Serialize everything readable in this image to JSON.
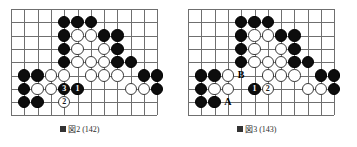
{
  "page": {
    "kind": "go-problem-diagram-pair",
    "width": 357,
    "height": 147,
    "background": "#ffffff"
  },
  "style": {
    "line_color": "#6f6f6f",
    "black_stone_color": "#0d0d0d",
    "white_stone_color": "#ffffff",
    "white_stone_border": "#3a3a3a",
    "label_color": "#000000"
  },
  "diagrams": [
    {
      "id": "left",
      "name": "figure-left",
      "caption": "図2 (142)",
      "origin_x": 11,
      "origin_y": 9,
      "pitch": 13.3,
      "cols": 12,
      "rows": 9,
      "stone_size": 12.4,
      "star_points": [
        {
          "c": 2,
          "r": 5
        }
      ],
      "stones": [
        {
          "c": 4,
          "r": 1,
          "color": "black",
          "label": ""
        },
        {
          "c": 5,
          "r": 1,
          "color": "black",
          "label": ""
        },
        {
          "c": 6,
          "r": 1,
          "color": "black",
          "label": ""
        },
        {
          "c": 4,
          "r": 2,
          "color": "black",
          "label": ""
        },
        {
          "c": 5,
          "r": 2,
          "color": "white",
          "label": ""
        },
        {
          "c": 6,
          "r": 2,
          "color": "white",
          "label": ""
        },
        {
          "c": 7,
          "r": 2,
          "color": "black",
          "label": ""
        },
        {
          "c": 8,
          "r": 2,
          "color": "black",
          "label": ""
        },
        {
          "c": 4,
          "r": 3,
          "color": "black",
          "label": ""
        },
        {
          "c": 5,
          "r": 3,
          "color": "white",
          "label": ""
        },
        {
          "c": 7,
          "r": 3,
          "color": "white",
          "label": ""
        },
        {
          "c": 8,
          "r": 3,
          "color": "black",
          "label": ""
        },
        {
          "c": 4,
          "r": 4,
          "color": "black",
          "label": ""
        },
        {
          "c": 5,
          "r": 4,
          "color": "white",
          "label": ""
        },
        {
          "c": 6,
          "r": 4,
          "color": "white",
          "label": ""
        },
        {
          "c": 7,
          "r": 4,
          "color": "white",
          "label": ""
        },
        {
          "c": 8,
          "r": 4,
          "color": "black",
          "label": ""
        },
        {
          "c": 9,
          "r": 4,
          "color": "black",
          "label": ""
        },
        {
          "c": 1,
          "r": 5,
          "color": "black",
          "label": ""
        },
        {
          "c": 2,
          "r": 5,
          "color": "black",
          "label": ""
        },
        {
          "c": 3,
          "r": 5,
          "color": "white",
          "label": ""
        },
        {
          "c": 4,
          "r": 5,
          "color": "white",
          "label": ""
        },
        {
          "c": 6,
          "r": 5,
          "color": "white",
          "label": ""
        },
        {
          "c": 7,
          "r": 5,
          "color": "white",
          "label": ""
        },
        {
          "c": 8,
          "r": 5,
          "color": "white",
          "label": ""
        },
        {
          "c": 10,
          "r": 5,
          "color": "black",
          "label": ""
        },
        {
          "c": 11,
          "r": 5,
          "color": "black",
          "label": ""
        },
        {
          "c": 1,
          "r": 6,
          "color": "black",
          "label": ""
        },
        {
          "c": 2,
          "r": 6,
          "color": "white",
          "label": ""
        },
        {
          "c": 3,
          "r": 6,
          "color": "white",
          "label": ""
        },
        {
          "c": 4,
          "r": 6,
          "color": "black",
          "label": "3"
        },
        {
          "c": 5,
          "r": 6,
          "color": "black",
          "label": "1"
        },
        {
          "c": 9,
          "r": 6,
          "color": "white",
          "label": ""
        },
        {
          "c": 10,
          "r": 6,
          "color": "white",
          "label": ""
        },
        {
          "c": 11,
          "r": 6,
          "color": "black",
          "label": ""
        },
        {
          "c": 1,
          "r": 7,
          "color": "black",
          "label": ""
        },
        {
          "c": 2,
          "r": 7,
          "color": "black",
          "label": ""
        },
        {
          "c": 4,
          "r": 7,
          "color": "white",
          "label": "2"
        }
      ],
      "marks": []
    },
    {
      "id": "right",
      "name": "figure-right",
      "caption": "図3 (143)",
      "origin_x": 11,
      "origin_y": 9,
      "pitch": 13.3,
      "cols": 12,
      "rows": 9,
      "stone_size": 12.4,
      "star_points": [
        {
          "c": 2,
          "r": 5
        }
      ],
      "stones": [
        {
          "c": 4,
          "r": 1,
          "color": "black",
          "label": ""
        },
        {
          "c": 5,
          "r": 1,
          "color": "black",
          "label": ""
        },
        {
          "c": 6,
          "r": 1,
          "color": "black",
          "label": ""
        },
        {
          "c": 4,
          "r": 2,
          "color": "black",
          "label": ""
        },
        {
          "c": 5,
          "r": 2,
          "color": "white",
          "label": ""
        },
        {
          "c": 6,
          "r": 2,
          "color": "white",
          "label": ""
        },
        {
          "c": 7,
          "r": 2,
          "color": "black",
          "label": ""
        },
        {
          "c": 8,
          "r": 2,
          "color": "black",
          "label": ""
        },
        {
          "c": 4,
          "r": 3,
          "color": "black",
          "label": ""
        },
        {
          "c": 5,
          "r": 3,
          "color": "white",
          "label": ""
        },
        {
          "c": 7,
          "r": 3,
          "color": "white",
          "label": ""
        },
        {
          "c": 8,
          "r": 3,
          "color": "black",
          "label": ""
        },
        {
          "c": 4,
          "r": 4,
          "color": "black",
          "label": ""
        },
        {
          "c": 5,
          "r": 4,
          "color": "white",
          "label": ""
        },
        {
          "c": 6,
          "r": 4,
          "color": "white",
          "label": ""
        },
        {
          "c": 7,
          "r": 4,
          "color": "white",
          "label": ""
        },
        {
          "c": 8,
          "r": 4,
          "color": "black",
          "label": ""
        },
        {
          "c": 9,
          "r": 4,
          "color": "black",
          "label": ""
        },
        {
          "c": 1,
          "r": 5,
          "color": "black",
          "label": ""
        },
        {
          "c": 2,
          "r": 5,
          "color": "black",
          "label": ""
        },
        {
          "c": 3,
          "r": 5,
          "color": "white",
          "label": ""
        },
        {
          "c": 6,
          "r": 5,
          "color": "white",
          "label": ""
        },
        {
          "c": 7,
          "r": 5,
          "color": "white",
          "label": ""
        },
        {
          "c": 8,
          "r": 5,
          "color": "white",
          "label": ""
        },
        {
          "c": 10,
          "r": 5,
          "color": "black",
          "label": ""
        },
        {
          "c": 11,
          "r": 5,
          "color": "black",
          "label": ""
        },
        {
          "c": 1,
          "r": 6,
          "color": "black",
          "label": ""
        },
        {
          "c": 2,
          "r": 6,
          "color": "white",
          "label": ""
        },
        {
          "c": 3,
          "r": 6,
          "color": "white",
          "label": ""
        },
        {
          "c": 5,
          "r": 6,
          "color": "black",
          "label": "1"
        },
        {
          "c": 6,
          "r": 6,
          "color": "white",
          "label": "2"
        },
        {
          "c": 9,
          "r": 6,
          "color": "white",
          "label": ""
        },
        {
          "c": 10,
          "r": 6,
          "color": "white",
          "label": ""
        },
        {
          "c": 11,
          "r": 6,
          "color": "black",
          "label": ""
        },
        {
          "c": 1,
          "r": 7,
          "color": "black",
          "label": ""
        },
        {
          "c": 2,
          "r": 7,
          "color": "black",
          "label": ""
        }
      ],
      "marks": [
        {
          "c": 4,
          "r": 5,
          "text": "B"
        },
        {
          "c": 3,
          "r": 7,
          "text": "A"
        }
      ]
    }
  ]
}
